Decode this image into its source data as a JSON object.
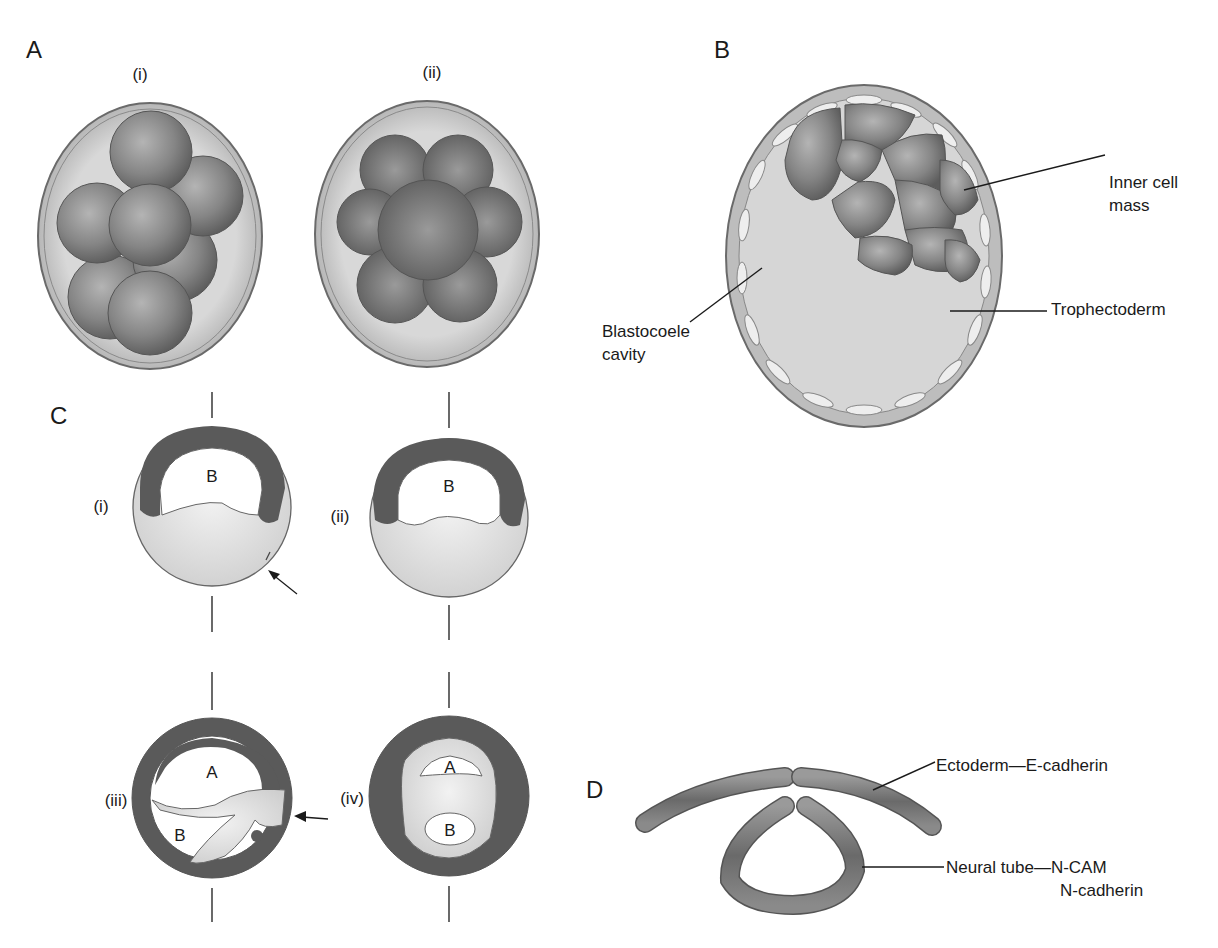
{
  "panels": {
    "A": {
      "letter": "A",
      "sub": [
        "(i)",
        "(ii)"
      ]
    },
    "B": {
      "letter": "B",
      "labels": {
        "inner_cell_mass_1": "Inner cell",
        "inner_cell_mass_2": "mass",
        "trophectoderm": "Trophectoderm",
        "blastocoele_1": "Blastocoele",
        "blastocoele_2": "cavity"
      }
    },
    "C": {
      "letter": "C",
      "sub": [
        "(i)",
        "(ii)",
        "(iii)",
        "(iv)"
      ],
      "cavity_labels": {
        "i_B": "B",
        "ii_B": "B",
        "iii_A": "A",
        "iii_B": "B",
        "iv_A": "A",
        "iv_B": "B"
      }
    },
    "D": {
      "letter": "D",
      "labels": {
        "ectoderm": "Ectoderm—E-cadherin",
        "neural_tube_1": "Neural tube—N-CAM",
        "neural_tube_2": "N-cadherin"
      }
    }
  },
  "colors": {
    "cell_dark": "#6e6e6e",
    "cell_mid": "#8c8c8c",
    "zona_light": "#d6d6d6",
    "ectoderm_band": "#5a5a5a",
    "yolk_light": "#e4e4e4",
    "outline": "#555555"
  }
}
